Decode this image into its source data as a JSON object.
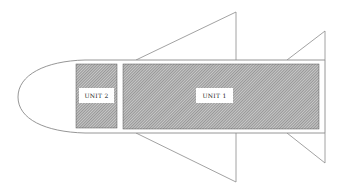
{
  "diagram": {
    "type": "rocket-schematic",
    "units": [
      {
        "id": "unit-1",
        "label": "UNIT 1"
      },
      {
        "id": "unit-2",
        "label": "UNIT 2"
      }
    ],
    "colors": {
      "outline": "#8a8a8a",
      "hatch_dark": "#6e6e6e",
      "hatch_light": "#c8c8c8",
      "label_bg": "#ffffff",
      "background": "#ffffff"
    }
  }
}
